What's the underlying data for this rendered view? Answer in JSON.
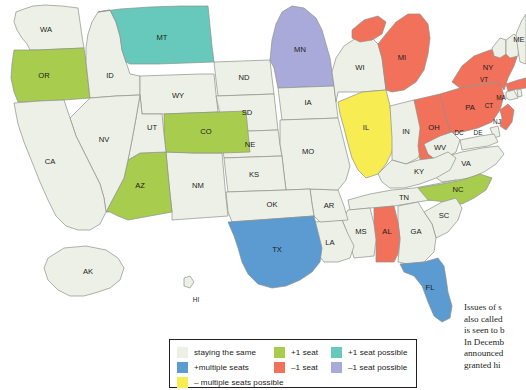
{
  "map": {
    "title": "US congressional reapportionment map",
    "projection": "albers-usa",
    "colors": {
      "staying_the_same": "#edf0e6",
      "plus_one_seat": "#a8cd4e",
      "plus_one_seat_possible": "#67c9bb",
      "plus_multiple_seats": "#5b9bd1",
      "minus_one_seat": "#f2715a",
      "minus_one_seat_possible": "#a9aada",
      "minus_multiple_seats_possible": "#f8ec53",
      "border": "#8d9089",
      "label": "#1b1b1b"
    },
    "states": [
      {
        "code": "WA",
        "label": "WA",
        "status": "staying_the_same"
      },
      {
        "code": "OR",
        "label": "OR",
        "status": "plus_one_seat"
      },
      {
        "code": "ID",
        "label": "ID",
        "status": "staying_the_same"
      },
      {
        "code": "MT",
        "label": "MT",
        "status": "plus_one_seat_possible"
      },
      {
        "code": "WY",
        "label": "WY",
        "status": "staying_the_same"
      },
      {
        "code": "ND",
        "label": "ND",
        "status": "staying_the_same"
      },
      {
        "code": "SD",
        "label": "SD",
        "status": "staying_the_same"
      },
      {
        "code": "NE",
        "label": "NE",
        "status": "staying_the_same"
      },
      {
        "code": "MN",
        "label": "MN",
        "status": "minus_one_seat_possible"
      },
      {
        "code": "IA",
        "label": "IA",
        "status": "staying_the_same"
      },
      {
        "code": "WI",
        "label": "WI",
        "status": "staying_the_same"
      },
      {
        "code": "MI",
        "label": "MI",
        "status": "minus_one_seat"
      },
      {
        "code": "IL",
        "label": "IL",
        "status": "minus_multiple_seats_possible"
      },
      {
        "code": "IN",
        "label": "IN",
        "status": "staying_the_same"
      },
      {
        "code": "OH",
        "label": "OH",
        "status": "minus_one_seat"
      },
      {
        "code": "PA",
        "label": "PA",
        "status": "minus_one_seat"
      },
      {
        "code": "NY",
        "label": "NY",
        "status": "minus_one_seat"
      },
      {
        "code": "NJ",
        "label": "NJ",
        "status": "minus_one_seat"
      },
      {
        "code": "MA",
        "label": "MA",
        "status": "minus_one_seat"
      },
      {
        "code": "CT",
        "label": "CT",
        "status": "staying_the_same"
      },
      {
        "code": "RI",
        "label": "RI",
        "status": "staying_the_same"
      },
      {
        "code": "VT",
        "label": "VT",
        "status": "staying_the_same"
      },
      {
        "code": "NH",
        "label": "NH",
        "status": "staying_the_same"
      },
      {
        "code": "ME",
        "label": "ME",
        "status": "staying_the_same"
      },
      {
        "code": "WV",
        "label": "WV",
        "status": "staying_the_same"
      },
      {
        "code": "VA",
        "label": "VA",
        "status": "staying_the_same"
      },
      {
        "code": "DC",
        "label": "DC",
        "status": "staying_the_same"
      },
      {
        "code": "DE",
        "label": "DE",
        "status": "staying_the_same"
      },
      {
        "code": "MD",
        "label": "MD",
        "status": "staying_the_same"
      },
      {
        "code": "KY",
        "label": "KY",
        "status": "staying_the_same"
      },
      {
        "code": "TN",
        "label": "TN",
        "status": "staying_the_same"
      },
      {
        "code": "NC",
        "label": "NC",
        "status": "plus_one_seat"
      },
      {
        "code": "SC",
        "label": "SC",
        "status": "staying_the_same"
      },
      {
        "code": "GA",
        "label": "GA",
        "status": "staying_the_same"
      },
      {
        "code": "AL",
        "label": "AL",
        "status": "minus_one_seat"
      },
      {
        "code": "MS",
        "label": "MS",
        "status": "staying_the_same"
      },
      {
        "code": "FL",
        "label": "FL",
        "status": "plus_multiple_seats"
      },
      {
        "code": "LA",
        "label": "LA",
        "status": "staying_the_same"
      },
      {
        "code": "AR",
        "label": "AR",
        "status": "staying_the_same"
      },
      {
        "code": "MO",
        "label": "MO",
        "status": "staying_the_same"
      },
      {
        "code": "KS",
        "label": "KS",
        "status": "staying_the_same"
      },
      {
        "code": "OK",
        "label": "OK",
        "status": "staying_the_same"
      },
      {
        "code": "TX",
        "label": "TX",
        "status": "plus_multiple_seats"
      },
      {
        "code": "NM",
        "label": "NM",
        "status": "staying_the_same"
      },
      {
        "code": "AZ",
        "label": "AZ",
        "status": "plus_one_seat"
      },
      {
        "code": "CO",
        "label": "CO",
        "status": "plus_one_seat"
      },
      {
        "code": "UT",
        "label": "UT",
        "status": "staying_the_same"
      },
      {
        "code": "NV",
        "label": "NV",
        "status": "staying_the_same"
      },
      {
        "code": "CA",
        "label": "CA",
        "status": "staying_the_same"
      },
      {
        "code": "AK",
        "label": "AK",
        "status": "staying_the_same"
      },
      {
        "code": "HI",
        "label": "HI",
        "status": "staying_the_same"
      }
    ]
  },
  "legend": {
    "rows": [
      [
        {
          "key": "staying_the_same",
          "label": "staying the same",
          "color": "#edf0e6"
        },
        {
          "key": "plus_one_seat",
          "label": "+1 seat",
          "color": "#a8cd4e"
        },
        {
          "key": "plus_one_seat_possible",
          "label": "+1 seat possible",
          "color": "#67c9bb"
        }
      ],
      [
        {
          "key": "plus_multiple_seats",
          "label": "+multiple seats",
          "color": "#5b9bd1"
        },
        {
          "key": "minus_one_seat",
          "label": "–1 seat",
          "color": "#f2715a"
        },
        {
          "key": "minus_one_seat_possible",
          "label": "–1 seat possible",
          "color": "#a9aada"
        }
      ],
      [
        {
          "key": "minus_multiple_seats_possible",
          "label": "– multiple seats possible",
          "color": "#f8ec53"
        }
      ]
    ]
  },
  "sidebar_text": {
    "lines": [
      "Issues of s",
      "also called",
      "is seen to b",
      "In Decemb",
      "announced",
      "granted hi"
    ]
  }
}
